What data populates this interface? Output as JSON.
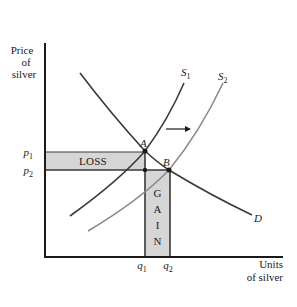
{
  "diagram": {
    "axes": {
      "y_label_lines": [
        "Price",
        "of",
        "silver"
      ],
      "x_label_lines": [
        "Units",
        "of silver"
      ]
    },
    "price_ticks": [
      {
        "base": "p",
        "sub": "1"
      },
      {
        "base": "p",
        "sub": "2"
      }
    ],
    "quantity_ticks": [
      {
        "base": "q",
        "sub": "1"
      },
      {
        "base": "q",
        "sub": "2"
      }
    ],
    "curves": [
      {
        "name": "S",
        "sub": "1",
        "kind": "supply",
        "color": "#3a3a3a"
      },
      {
        "name": "S",
        "sub": "2",
        "kind": "supply",
        "color": "#8a8a8a"
      },
      {
        "name": "D",
        "sub": "",
        "kind": "demand",
        "color": "#3a3a3a"
      }
    ],
    "points": [
      {
        "label": "A",
        "desc": "intersection of S1 and D at (q1, p1)"
      },
      {
        "label": "B",
        "desc": "intersection of S2 and D at (q2, p2)"
      }
    ],
    "regions": {
      "loss": {
        "label": "LOSS",
        "fill": "#d6d6d6"
      },
      "gain": {
        "label_letters": [
          "G",
          "A",
          "I",
          "N"
        ],
        "fill": "#d6d6d6"
      }
    },
    "shift_arrow": {
      "direction": "right",
      "meaning": "supply shifts from S1 to S2"
    }
  }
}
